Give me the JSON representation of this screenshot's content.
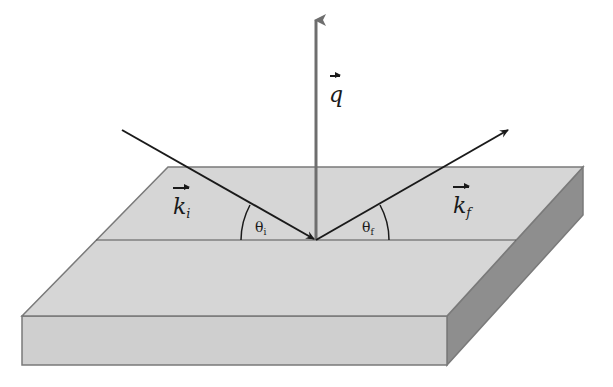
{
  "diagram": {
    "type": "grazing-incidence scattering geometry",
    "labels": {
      "q_symbol": "q",
      "ki_symbol": "k",
      "ki_sub": "i",
      "kf_symbol": "k",
      "kf_sub": "f",
      "theta_i_symbol": "θ",
      "theta_i_sub": "i",
      "theta_f_symbol": "θ",
      "theta_f_sub": "f"
    },
    "colors": {
      "top_face": "#d6d6d6",
      "front_face": "#cfcfcf",
      "side_face": "#8e8e8e",
      "edge": "#7a7a7a",
      "beam": "#1a1a1a",
      "q_vector": "#6e6e6e"
    }
  }
}
